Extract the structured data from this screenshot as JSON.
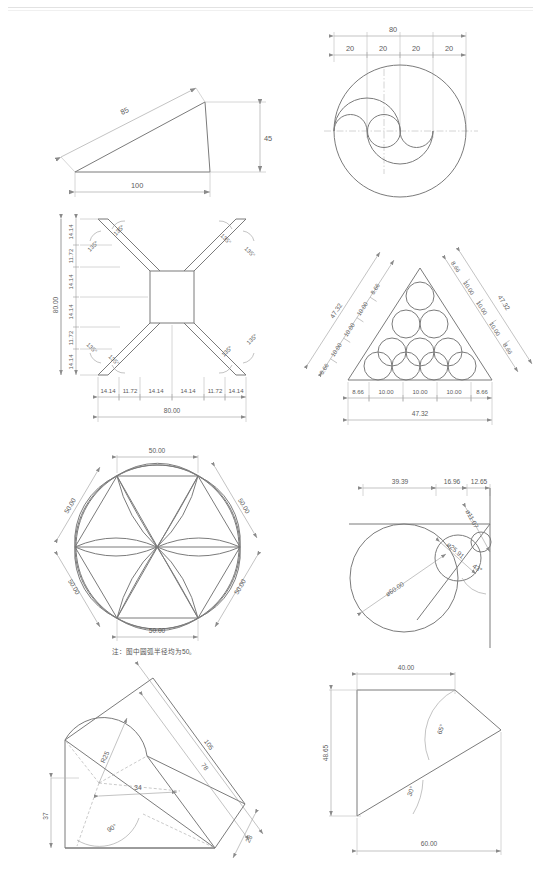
{
  "sheet": {
    "title": "CAD Drafting Practice Sheet",
    "background_color": "#ffffff",
    "line_color": "#8a8a8a",
    "dimension_color": "#9a9a9a",
    "text_color": "#5c5c5c",
    "width": 541,
    "height": 887
  },
  "figures": [
    {
      "id": "fig-1",
      "name": "oblique-triangle",
      "type": "triangle",
      "dimensions": [
        {
          "label": "85",
          "kind": "aligned",
          "position": "upper-left-edge"
        },
        {
          "label": "45",
          "kind": "linear-vertical",
          "position": "right"
        },
        {
          "label": "100",
          "kind": "linear-horizontal",
          "position": "bottom"
        }
      ]
    },
    {
      "id": "fig-2",
      "name": "yin-yang-circle-construction",
      "type": "circles",
      "dimensions": [
        {
          "label": "80",
          "kind": "linear-horizontal",
          "position": "top-overall"
        },
        {
          "label": "20",
          "kind": "linear-horizontal",
          "position": "top-chain-1"
        },
        {
          "label": "20",
          "kind": "linear-horizontal",
          "position": "top-chain-2"
        },
        {
          "label": "20",
          "kind": "linear-horizontal",
          "position": "top-chain-3"
        },
        {
          "label": "20",
          "kind": "linear-horizontal",
          "position": "top-chain-4"
        }
      ]
    },
    {
      "id": "fig-3",
      "name": "cross-star-with-square",
      "type": "polygon",
      "vertical_chain": [
        "14.14",
        "11.72",
        "14.14",
        "14.14",
        "11.72",
        "14.14"
      ],
      "vertical_total": "80.00",
      "horizontal_chain": [
        "14.14",
        "11.72",
        "14.14",
        "14.14",
        "11.72",
        "14.14"
      ],
      "horizontal_total": "80.00",
      "angles": [
        "135°",
        "135°",
        "135°",
        "135°",
        "135°",
        "135°",
        "135°",
        "135°"
      ]
    },
    {
      "id": "fig-4",
      "name": "triangle-with-packed-circles",
      "type": "triangle-circles",
      "circle_rows": [
        1,
        2,
        3,
        4
      ],
      "left_chain": [
        "8.66",
        "10.00",
        "10.00",
        "10.00",
        "8.66"
      ],
      "left_total": "47.32",
      "right_chain": [
        "8.66",
        "10.00",
        "10.00",
        "10.00",
        "8.66"
      ],
      "right_total": "47.32",
      "bottom_chain": [
        "8.66",
        "10.00",
        "10.00",
        "10.00",
        "8.66"
      ],
      "bottom_total": "47.32"
    },
    {
      "id": "fig-5",
      "name": "hexagon-flower-pattern",
      "type": "hexagon-arcs",
      "edges": [
        "50.00",
        "50.00",
        "50.00",
        "50.00",
        "50.00",
        "50.00"
      ],
      "note": "注：图中圆弧半径均为50。"
    },
    {
      "id": "fig-6",
      "name": "tangent-circle-chain",
      "type": "tangent-circles",
      "dimensions": [
        {
          "label": "39.39",
          "kind": "linear-horizontal",
          "position": "top-chain-1"
        },
        {
          "label": "16.96",
          "kind": "linear-horizontal",
          "position": "top-chain-2"
        },
        {
          "label": "12.65",
          "kind": "linear-horizontal",
          "position": "top-chain-3"
        },
        {
          "label": "ø60.00",
          "kind": "diameter",
          "position": "large-circle"
        },
        {
          "label": "ø25.91",
          "kind": "diameter",
          "position": "middle-circle"
        },
        {
          "label": "ø11.07",
          "kind": "diameter",
          "position": "small-circle"
        },
        {
          "label": "43°",
          "kind": "angle",
          "position": "apex"
        }
      ]
    },
    {
      "id": "fig-7",
      "name": "arc-and-polygon-composite",
      "type": "composite",
      "dimensions": [
        {
          "label": "105",
          "kind": "aligned",
          "position": "outer-upper"
        },
        {
          "label": "78",
          "kind": "aligned",
          "position": "inner-upper"
        },
        {
          "label": "28",
          "kind": "aligned",
          "position": "lower-right"
        },
        {
          "label": "37",
          "kind": "aligned",
          "position": "left"
        },
        {
          "label": "R25",
          "kind": "radius",
          "position": "arc"
        },
        {
          "label": "34",
          "kind": "aligned",
          "position": "center"
        },
        {
          "label": "90°",
          "kind": "angle",
          "position": "center-lower"
        }
      ]
    },
    {
      "id": "fig-8",
      "name": "chamfered-rectangle",
      "type": "polygon",
      "dimensions": [
        {
          "label": "40.00",
          "kind": "linear-horizontal",
          "position": "top"
        },
        {
          "label": "48.65",
          "kind": "linear-vertical",
          "position": "left"
        },
        {
          "label": "60.00",
          "kind": "linear-horizontal",
          "position": "bottom"
        },
        {
          "label": "65°",
          "kind": "angle",
          "position": "upper-right"
        },
        {
          "label": "30°",
          "kind": "angle",
          "position": "lower-left"
        }
      ]
    }
  ]
}
